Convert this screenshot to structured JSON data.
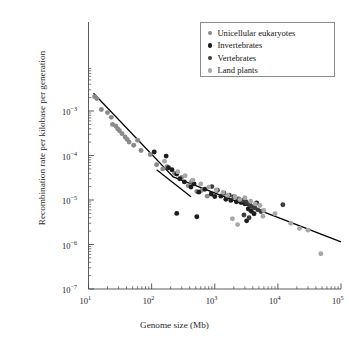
{
  "figure": {
    "xlabel": "Genome size (Mb)",
    "ylabel": "Recombination rate per kilobase per generation"
  },
  "legend": {
    "items": [
      {
        "label": "Unicellular eukaryotes",
        "color": "#8a8a8a"
      },
      {
        "label": "Invertebrates",
        "color": "#1c1c1c"
      },
      {
        "label": "Vertebrates",
        "color": "#3d3d3d"
      },
      {
        "label": "Land plants",
        "color": "#a8a8a8"
      }
    ]
  },
  "axes": {
    "x_ticks": [
      {
        "value": 10,
        "label_base": "10",
        "label_exp": "1"
      },
      {
        "value": 100,
        "label_base": "10",
        "label_exp": "2"
      },
      {
        "value": 1000,
        "label_base": "10",
        "label_exp": "3"
      },
      {
        "value": 10000,
        "label_base": "10",
        "label_exp": "4"
      },
      {
        "value": 100000,
        "label_base": "10",
        "label_exp": "5"
      }
    ],
    "y_ticks": [
      {
        "value": 0.001,
        "label_base": "10",
        "label_exp": "−3"
      },
      {
        "value": 0.0001,
        "label_base": "10",
        "label_exp": "−4"
      },
      {
        "value": 1e-05,
        "label_base": "10",
        "label_exp": "−5"
      },
      {
        "value": 1e-06,
        "label_base": "10",
        "label_exp": "−6"
      },
      {
        "value": 1e-07,
        "label_base": "10",
        "label_exp": "−7"
      }
    ]
  },
  "chart_data": {
    "type": "scatter",
    "title": "",
    "xlabel": "Genome size (Mb)",
    "ylabel": "Recombination rate per kilobase per generation",
    "xscale": "log",
    "yscale": "log",
    "xlim": [
      10,
      100000
    ],
    "ylim": [
      1e-07,
      0.0032
    ],
    "grid": false,
    "legend_position": "top-right",
    "series": [
      {
        "name": "Unicellular eukaryotes",
        "color": "#8a8a8a",
        "points": [
          [
            12.5,
            0.0021
          ],
          [
            13.5,
            0.0019
          ],
          [
            16.0,
            0.00108
          ],
          [
            20.0,
            0.00092
          ],
          [
            23.0,
            0.00072
          ],
          [
            24.0,
            0.0005
          ],
          [
            27.0,
            0.00046
          ],
          [
            29.0,
            0.0004
          ],
          [
            31.0,
            0.00036
          ],
          [
            34.0,
            0.00031
          ],
          [
            38.0,
            0.00026
          ],
          [
            41.0,
            0.00023
          ],
          [
            44.0,
            0.0002
          ],
          [
            52.0,
            0.00017
          ],
          [
            60.0,
            0.00022
          ],
          [
            68.0,
            0.00013
          ],
          [
            95.0,
            0.000105
          ],
          [
            120.0,
            6.2e-05
          ],
          [
            150.0,
            5e-05
          ],
          [
            175.0,
            5.6e-05
          ],
          [
            230.0,
            4e-05
          ],
          [
            300.0,
            3.2e-05
          ],
          [
            380.0,
            2.1e-05
          ],
          [
            430.0,
            2.6e-05
          ],
          [
            520.0,
            1.55e-05
          ],
          [
            620.0,
            1.65e-05
          ],
          [
            760.0,
            1.22e-05
          ]
        ]
      },
      {
        "name": "Invertebrates",
        "color": "#1c1c1c",
        "points": [
          [
            110.0,
            0.00012
          ],
          [
            170.0,
            9.7e-05
          ],
          [
            185.0,
            5.3e-05
          ],
          [
            210.0,
            4.8e-05
          ],
          [
            250.0,
            3.85e-05
          ],
          [
            280.0,
            3e-05
          ],
          [
            330.0,
            2.55e-05
          ],
          [
            420.0,
            1.95e-05
          ],
          [
            470.0,
            2.3e-05
          ],
          [
            560.0,
            1.5e-05
          ],
          [
            700.0,
            1.75e-05
          ],
          [
            880.0,
            1.36e-05
          ],
          [
            1000.0,
            1.2e-05
          ],
          [
            1250.0,
            1.22e-05
          ],
          [
            1500.0,
            1.04e-05
          ],
          [
            1800.0,
            9.8e-06
          ],
          [
            2200.0,
            9.1e-06
          ],
          [
            2600.0,
            8.8e-06
          ],
          [
            3000.0,
            8.2e-06
          ],
          [
            3400.0,
            6.3e-06
          ],
          [
            3800.0,
            5.6e-06
          ],
          [
            4200.0,
            4.9e-06
          ],
          [
            250.0,
            5e-06
          ],
          [
            520.0,
            4.2e-06
          ],
          [
            3200.0,
            3.4e-06
          ],
          [
            4600.0,
            8.6e-06
          ]
        ]
      },
      {
        "name": "Vertebrates",
        "color": "#3d3d3d",
        "points": [
          [
            900.0,
            2e-05
          ],
          [
            1100.0,
            1.65e-05
          ],
          [
            1400.0,
            1.42e-05
          ],
          [
            1700.0,
            1.28e-05
          ],
          [
            2000.0,
            1.18e-05
          ],
          [
            2400.0,
            1.05e-05
          ],
          [
            2800.0,
            9.8e-06
          ],
          [
            3100.0,
            9.2e-06
          ],
          [
            3300.0,
            8.4e-06
          ],
          [
            3600.0,
            7.7e-06
          ],
          [
            3900.0,
            7.1e-06
          ],
          [
            4300.0,
            6.7e-06
          ],
          [
            4800.0,
            6e-06
          ],
          [
            5400.0,
            5.5e-06
          ],
          [
            2900.0,
            4.6e-06
          ],
          [
            3500.0,
            4e-06
          ],
          [
            12000.0,
            7.8e-06
          ]
        ]
      },
      {
        "name": "Land plants",
        "color": "#a8a8a8",
        "points": [
          [
            160.0,
            7.4e-05
          ],
          [
            260.0,
            4.3e-05
          ],
          [
            340.0,
            3.5e-05
          ],
          [
            450.0,
            2.8e-05
          ],
          [
            600.0,
            2.3e-05
          ],
          [
            800.0,
            1.95e-05
          ],
          [
            1050.0,
            1.68e-05
          ],
          [
            1350.0,
            1.48e-05
          ],
          [
            1600.0,
            1.28e-05
          ],
          [
            2100.0,
            1.18e-05
          ],
          [
            2500.0,
            1.02e-05
          ],
          [
            3000.0,
            1.12e-05
          ],
          [
            3700.0,
            9.4e-06
          ],
          [
            4400.0,
            8.2e-06
          ],
          [
            5200.0,
            7.5e-06
          ],
          [
            6000.0,
            5.8e-06
          ],
          [
            1900.0,
            3.8e-06
          ],
          [
            5800.0,
            4.3e-06
          ],
          [
            2300.0,
            2.8e-06
          ],
          [
            9000.0,
            4.9e-06
          ],
          [
            16000.0,
            3e-06
          ],
          [
            22000.0,
            2.3e-06
          ],
          [
            30000.0,
            2.1e-06
          ],
          [
            48000.0,
            6.2e-07
          ]
        ]
      }
    ],
    "trend_lines": [
      {
        "name": "main-regression",
        "points": [
          [
            12.0,
            0.0025
          ],
          [
            220.0,
            3.3e-05
          ],
          [
            100000.0,
            1.15e-06
          ]
        ]
      },
      {
        "name": "short-segment",
        "points": [
          [
            120.0,
            4.8e-05
          ],
          [
            420.0,
            1.18e-05
          ]
        ]
      }
    ]
  }
}
